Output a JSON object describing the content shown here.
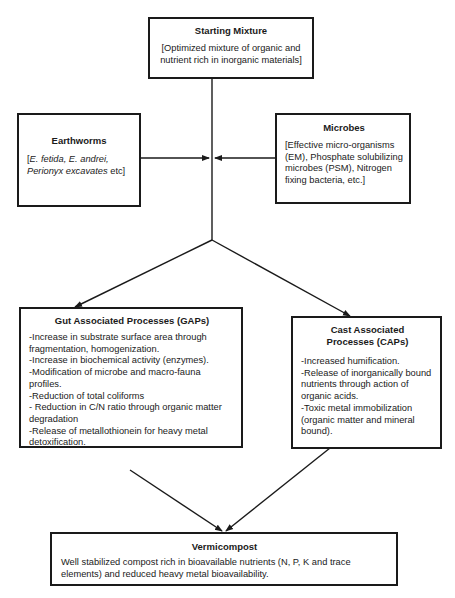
{
  "diagram": {
    "type": "flowchart",
    "nodes": {
      "starting_mixture": {
        "title": "Starting Mixture",
        "text": "[Optimized mixture of organic and nutrient rich in inorganic materials]"
      },
      "earthworms": {
        "title": "Earthworms",
        "open_bracket": "[",
        "species": "E. fetida, E. andrei, Perionyx excavates",
        "suffix": " etc]"
      },
      "microbes": {
        "title": "Microbes",
        "text": "[Effective micro-organisms (EM), Phosphate solubilizing microbes (PSM), Nitrogen fixing bacteria, etc.]"
      },
      "gaps": {
        "title": "Gut Associated Processes (GAPs)",
        "items": [
          "-Increase in substrate surface area through fragmentation, homogenization.",
          "-Increase in biochemical activity (enzymes).",
          "-Modification of microbe and macro-fauna profiles.",
          "-Reduction of total coliforms",
          "- Reduction in C/N ratio through organic matter degradation",
          "-Release of metallothionein for heavy metal detoxification."
        ]
      },
      "caps": {
        "title": "Cast Associated Processes (CAPs)",
        "items": [
          "-Increased humification.",
          "-Release of inorganically bound nutrients through action of organic acids.",
          "-Toxic metal immobilization (organic matter and mineral bound)."
        ]
      },
      "vermicompost": {
        "title": "Vermicompost",
        "text": "Well stabilized compost rich in bioavailable nutrients (N, P, K and trace elements) and reduced heavy metal bioavailability."
      }
    },
    "edges": [
      {
        "from": "starting_mixture",
        "to": "junction"
      },
      {
        "from": "earthworms",
        "to": "junction"
      },
      {
        "from": "microbes",
        "to": "junction"
      },
      {
        "from": "junction",
        "to": "gaps"
      },
      {
        "from": "junction",
        "to": "caps"
      },
      {
        "from": "gaps",
        "to": "vermicompost"
      },
      {
        "from": "caps",
        "to": "vermicompost"
      }
    ],
    "colors": {
      "line": "#1a1a1a",
      "background": "#ffffff"
    }
  }
}
